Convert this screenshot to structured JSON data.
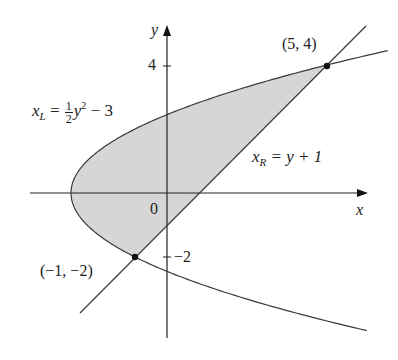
{
  "figure": {
    "axes": {
      "x_label": "x",
      "y_label": "y",
      "origin_label": "0",
      "y_ticks": [
        {
          "value": 4,
          "label": "4"
        },
        {
          "value": -2,
          "label": "−2"
        }
      ]
    },
    "curves": {
      "left": {
        "name_var": "x",
        "name_sub": "L",
        "eq_mid": " = ",
        "frac_num": "1",
        "frac_den": "2",
        "eq_y": "y",
        "eq_pow": "2",
        "eq_tail": " − 3"
      },
      "right": {
        "name_var": "x",
        "name_sub": "R",
        "eq_tail": " = y + 1"
      }
    },
    "points": [
      {
        "label": "(5, 4)",
        "x": 5,
        "y": 4
      },
      {
        "label": "(−1, −2)",
        "x": -1,
        "y": -2
      }
    ],
    "colors": {
      "shade": "#d6d6d6",
      "stroke": "#3a3a3a",
      "axis": "#222222"
    }
  }
}
